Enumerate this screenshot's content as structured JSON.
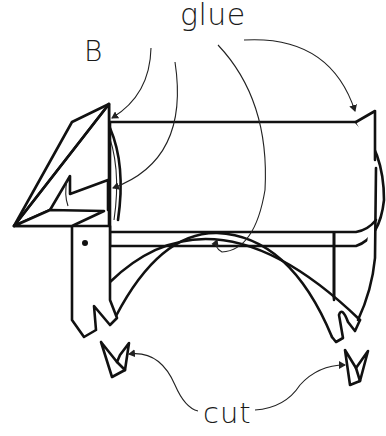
{
  "diagram": {
    "labels": {
      "part_letter": "B",
      "glue": "glue",
      "cut": "cut"
    },
    "callouts": [
      {
        "label": "glue",
        "targets": [
          "head-top-join",
          "head-inner-join",
          "leg-arch-top",
          "tail-join"
        ]
      },
      {
        "label": "cut",
        "targets": [
          "front-foot-notch",
          "back-foot-notch"
        ]
      }
    ],
    "parts": [
      "head",
      "eye",
      "front-leg",
      "tube-body",
      "leg-arch",
      "back-leg",
      "tail",
      "cut-notch-front",
      "cut-notch-back"
    ],
    "colors": {
      "background": "#ffffff",
      "line": "#111111"
    }
  }
}
